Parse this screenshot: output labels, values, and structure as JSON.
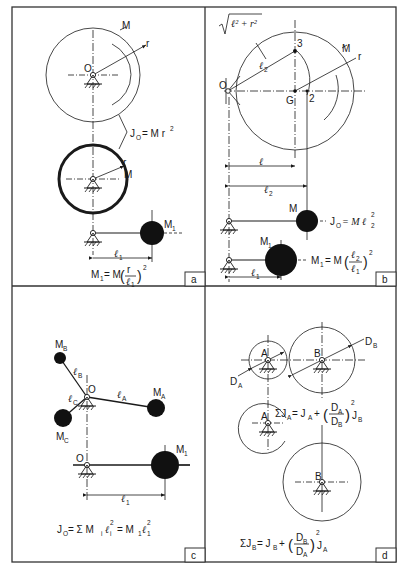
{
  "colors": {
    "ink": "#1a1a1a",
    "paper": "#ffffff",
    "frame": "#333333"
  },
  "panels": {
    "a": {
      "tag": "a",
      "labels": {
        "M_top": "M",
        "r_top": "r",
        "O": "O",
        "r_ring": "r",
        "M_ring": "M",
        "M1": "M",
        "M1_sub": "1",
        "l1": "ℓ",
        "l1_sub": "1"
      },
      "eq_J": {
        "J": "J",
        "J_sub": "O",
        "rhs": "= M r",
        "sup": "2"
      },
      "eq_M1": {
        "lhs": "M",
        "lhs_sub": "1",
        "mid": "= M",
        "num": "r",
        "den": "ℓ",
        "den_sub": "1",
        "sup": "2"
      }
    },
    "b": {
      "tag": "b",
      "labels": {
        "sqrt_expr": "ℓ² + r²",
        "l2": "ℓ",
        "l2_sub": "2",
        "point3": "3",
        "M": "M",
        "r": "r",
        "O": "O",
        "G": "G",
        "point2": "2",
        "l": "ℓ",
        "dim_l2": "ℓ",
        "dim_l2_sub": "2",
        "M_ball": "M",
        "M1": "M",
        "M1_sub": "1",
        "dim_l1": "ℓ",
        "dim_l1_sub": "1"
      },
      "eq_J": {
        "J": "J",
        "J_sub": "O",
        "rhs": "= M ℓ",
        "sub": "2",
        "sup": "2"
      },
      "eq_M1": {
        "lhs": "M",
        "lhs_sub": "1",
        "mid": "= M",
        "num": "ℓ",
        "num_sub": "2",
        "den": "ℓ",
        "den_sub": "1",
        "sup": "2"
      }
    },
    "c": {
      "tag": "c",
      "labels": {
        "MB": "M",
        "MB_sub": "B",
        "lB": "ℓ",
        "lB_sub": "B",
        "O": "O",
        "lA": "ℓ",
        "lA_sub": "A",
        "MA": "M",
        "MA_sub": "A",
        "lC": "ℓ",
        "lC_sub": "C",
        "MC": "M",
        "MC_sub": "C",
        "O2": "O",
        "M1": "M",
        "M1_sub": "1",
        "l1": "ℓ",
        "l1_sub": "1"
      },
      "eq": {
        "J": "J",
        "J_sub": "O",
        "text": "= Σ M",
        "s1": "i",
        "l": "ℓ",
        "s2": "i",
        "sup": "2",
        "text2": "= M",
        "s3": "1",
        "l2": "ℓ",
        "s4": "1",
        "sup2": "2"
      }
    },
    "d": {
      "tag": "d",
      "labels": {
        "A": "A",
        "B": "B",
        "DA": "D",
        "DA_sub": "A",
        "DB": "D",
        "DB_sub": "B",
        "A2": "A",
        "B2": "B"
      },
      "eq_A": {
        "lhs": "ΣJ",
        "lhs_sub": "A",
        "mid": "= J",
        "mid_sub": "A",
        "plus": "+",
        "num": "D",
        "num_sub": "A",
        "den": "D",
        "den_sub": "B",
        "sup": "2",
        "tail": "J",
        "tail_sub": "B"
      },
      "eq_B": {
        "lhs": "ΣJ",
        "lhs_sub": "B",
        "mid": "= J",
        "mid_sub": "B",
        "plus": "+",
        "num": "D",
        "num_sub": "B",
        "den": "D",
        "den_sub": "A",
        "sup": "2",
        "tail": "J",
        "tail_sub": "A"
      }
    }
  }
}
